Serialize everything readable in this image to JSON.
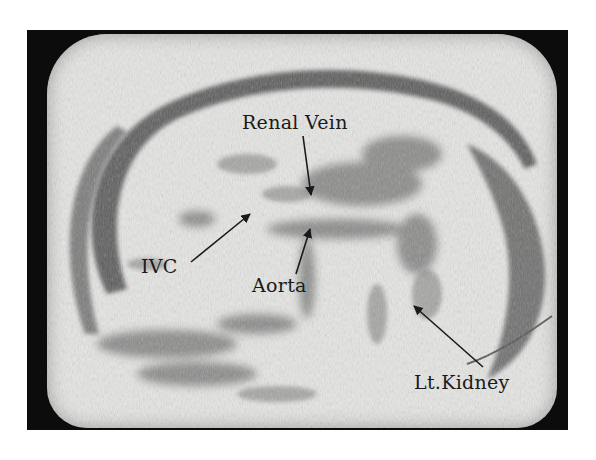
{
  "figure": {
    "type": "ultrasound-scan",
    "labels": [
      {
        "id": "renal-vein",
        "text": "Renal Vein"
      },
      {
        "id": "ivc",
        "text": "IVC"
      },
      {
        "id": "aorta",
        "text": "Aorta"
      },
      {
        "id": "lt-kidney",
        "text": "Lt.Kidney"
      }
    ],
    "colors": {
      "frame": "#0c0c0c",
      "screen": "#e6e6e4",
      "tissue_dark": "#555555",
      "text": "#1a1a1a"
    }
  }
}
